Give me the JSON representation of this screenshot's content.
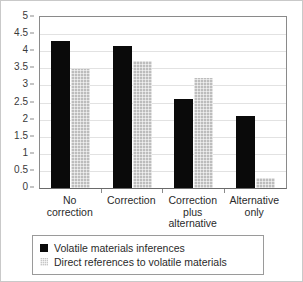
{
  "chart_data": {
    "type": "bar",
    "title": "",
    "xlabel": "",
    "ylabel": "",
    "ylim": [
      0,
      5
    ],
    "ytick_step": 0.5,
    "yticks": [
      "5",
      "4.5",
      "4",
      "3.5",
      "3",
      "2.5",
      "2",
      "1.5",
      "1",
      "0.5",
      "0"
    ],
    "grid": true,
    "legend_position": "below-plot",
    "categories": [
      "No correction",
      "Correction",
      "Correction plus alternative",
      "Alternative only"
    ],
    "category_lines": [
      [
        "No",
        "correction"
      ],
      [
        "Correction"
      ],
      [
        "Correction",
        "plus",
        "alternative"
      ],
      [
        "Alternative",
        "only"
      ]
    ],
    "series": [
      {
        "name": "Volatile materials inferences",
        "color": "#0a0a0a",
        "values": [
          4.3,
          4.15,
          2.6,
          2.1
        ]
      },
      {
        "name": "Direct references to volatile materials",
        "color": "#bdbdbd",
        "values": [
          3.47,
          3.7,
          3.23,
          0.3
        ]
      }
    ]
  },
  "legend": {
    "entries": [
      {
        "label": "Volatile materials inferences"
      },
      {
        "label": "Direct references to volatile materials"
      }
    ]
  }
}
